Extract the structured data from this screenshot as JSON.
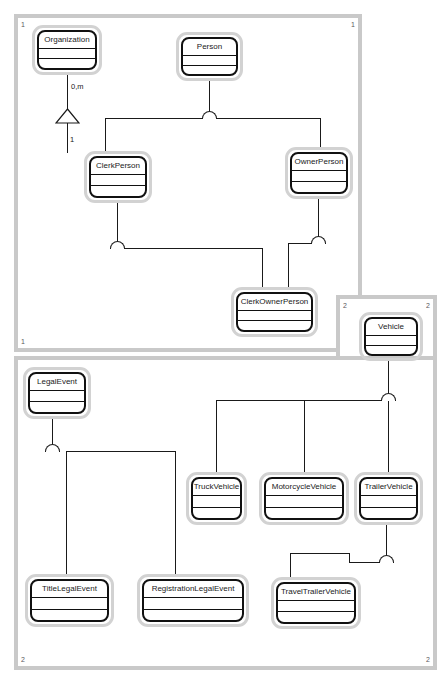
{
  "diagram": {
    "notation": "generalization-arc",
    "frames": [
      {
        "id": "frame-person",
        "corner_labels": {
          "top_left": "1",
          "top_right": "1",
          "bottom_left": "1",
          "bottom_right": "1"
        },
        "rect": {
          "x": 14,
          "y": 14,
          "w": 348,
          "h": 338
        }
      },
      {
        "id": "frame-vehicle",
        "corner_labels": {
          "top_left": "2",
          "top_right": "2"
        },
        "rect": {
          "x": 336,
          "y": 295,
          "w": 101,
          "h": 68
        }
      },
      {
        "id": "frame-events",
        "corner_labels": {
          "bottom_left": "2",
          "bottom_right": "2"
        },
        "rect": {
          "x": 14,
          "y": 356,
          "w": 423,
          "h": 314
        }
      }
    ],
    "classes": [
      {
        "id": "organization",
        "name": "Organization",
        "rect": {
          "x": 32,
          "y": 25,
          "w": 70,
          "h": 50
        }
      },
      {
        "id": "person",
        "name": "Person",
        "rect": {
          "x": 176,
          "y": 32,
          "w": 67,
          "h": 49
        }
      },
      {
        "id": "clerk-person",
        "name": "ClerkPerson",
        "rect": {
          "x": 84,
          "y": 151,
          "w": 68,
          "h": 52
        }
      },
      {
        "id": "owner-person",
        "name": "OwnerPerson",
        "rect": {
          "x": 285,
          "y": 147,
          "w": 68,
          "h": 52
        }
      },
      {
        "id": "clerk-owner-person",
        "name": "ClerkOwnerPerson",
        "rect": {
          "x": 231,
          "y": 287,
          "w": 87,
          "h": 50
        }
      },
      {
        "id": "vehicle",
        "name": "Vehicle",
        "rect": {
          "x": 359,
          "y": 312,
          "w": 64,
          "h": 49
        }
      },
      {
        "id": "legal-event",
        "name": "LegalEvent",
        "rect": {
          "x": 23,
          "y": 367,
          "w": 68,
          "h": 52
        }
      },
      {
        "id": "truck-vehicle",
        "name": "TruckVehicle",
        "rect": {
          "x": 186,
          "y": 472,
          "w": 61,
          "h": 53
        }
      },
      {
        "id": "motorcycle-vehicle",
        "name": "MotorcycleVehicle",
        "rect": {
          "x": 259,
          "y": 472,
          "w": 90,
          "h": 53
        }
      },
      {
        "id": "trailer-vehicle",
        "name": "TrailerVehicle",
        "rect": {
          "x": 354,
          "y": 472,
          "w": 69,
          "h": 53
        }
      },
      {
        "id": "title-legal-event",
        "name": "TitleLegalEvent",
        "rect": {
          "x": 25,
          "y": 574,
          "w": 89,
          "h": 53
        }
      },
      {
        "id": "registration-legal-event",
        "name": "RegistrationLegalEvent",
        "rect": {
          "x": 137,
          "y": 574,
          "w": 112,
          "h": 53
        }
      },
      {
        "id": "travel-trailer-vehicle",
        "name": "TravelTrailerVehicle",
        "rect": {
          "x": 271,
          "y": 577,
          "w": 90,
          "h": 52
        }
      }
    ],
    "multiplicities": [
      {
        "id": "org-clerk-source",
        "text": "0,m",
        "x": 71,
        "y": 83
      },
      {
        "id": "org-clerk-target",
        "text": "1",
        "x": 91,
        "y": 138
      }
    ],
    "relationships": [
      {
        "id": "rel-organization-clerkperson",
        "type": "generalization-triangle",
        "from": "Organization",
        "to": "ClerkPerson"
      },
      {
        "id": "rel-person-subtypes",
        "type": "generalization-arc",
        "from": "Person",
        "to": [
          "ClerkPerson",
          "OwnerPerson"
        ]
      },
      {
        "id": "rel-clerkperson-clerkowner",
        "type": "generalization-arc",
        "from": "ClerkPerson",
        "to": [
          "ClerkOwnerPerson"
        ]
      },
      {
        "id": "rel-ownerperson-clerkowner",
        "type": "generalization-arc",
        "from": "OwnerPerson",
        "to": [
          "ClerkOwnerPerson"
        ]
      },
      {
        "id": "rel-vehicle-subtypes",
        "type": "generalization-arc",
        "from": "Vehicle",
        "to": [
          "TruckVehicle",
          "MotorcycleVehicle",
          "TrailerVehicle"
        ]
      },
      {
        "id": "rel-trailer-travel",
        "type": "generalization-arc",
        "from": "TrailerVehicle",
        "to": [
          "TravelTrailerVehicle"
        ]
      },
      {
        "id": "rel-legalevent-subtypes",
        "type": "generalization-arc",
        "from": "LegalEvent",
        "to": [
          "TitleLegalEvent",
          "RegistrationLegalEvent"
        ]
      }
    ],
    "colors": {
      "frame_border": "#c9c9c9",
      "class_halo": "#d2d2d2",
      "class_border": "#111111",
      "line": "#1a1a1a",
      "background": "#ffffff",
      "text": "#1a1a1a"
    }
  }
}
